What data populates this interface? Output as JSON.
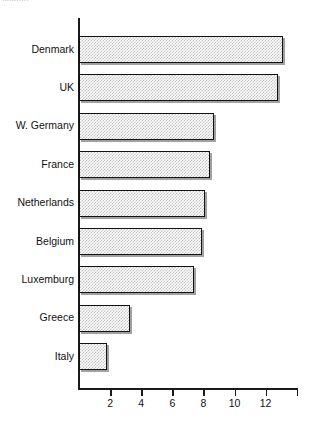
{
  "top_caption": "...........",
  "chart_data": {
    "type": "bar",
    "orientation": "horizontal",
    "title": "",
    "xlabel": "",
    "ylabel": "",
    "categories": [
      "Denmark",
      "UK",
      "W. Germany",
      "France",
      "Netherlands",
      "Belgium",
      "Luxemburg",
      "Greece",
      "Italy"
    ],
    "values": [
      13.1,
      12.8,
      8.7,
      8.4,
      8.1,
      7.9,
      7.4,
      3.3,
      1.8
    ],
    "xlim": [
      0,
      14.1
    ],
    "xticks": [
      2,
      4,
      6,
      8,
      10,
      12,
      14
    ],
    "xtick_labels": [
      "2",
      "4",
      "6",
      "8",
      "10",
      "12",
      ""
    ],
    "grid": false,
    "legend": null,
    "bar_fill": "#c4c4c4",
    "bar_edge": "#121212",
    "axis_color": "#1a1a1a"
  }
}
